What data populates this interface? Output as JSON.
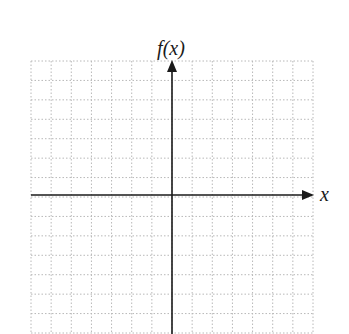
{
  "figure": {
    "type": "coordinate-grid",
    "y_axis_label": "f(x)",
    "x_axis_label": "x",
    "grid": {
      "columns": 14,
      "rows": 14,
      "left": 31,
      "top": 61,
      "right": 313,
      "bottom": 333,
      "cell_width": 20.14,
      "cell_height": 19.43,
      "line_style": "dotted",
      "line_color": "#b8b8b8"
    },
    "axes": {
      "origin_x": 172,
      "origin_y": 195,
      "color": "#1a1a1a",
      "y_axis_arrow": "top",
      "x_axis_arrow": "right"
    }
  }
}
